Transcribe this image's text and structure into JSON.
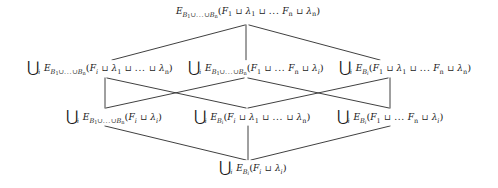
{
  "diagram": {
    "type": "hasse-lattice",
    "title": "",
    "nodes": [
      {
        "id": "top",
        "role": "top-element",
        "text": "E_{B1∪...∪Bn}(F1 ⊔ λ1 ⊔ ... Fn ⊔ λn)",
        "x": 248,
        "y": 12
      },
      {
        "id": "mid-left",
        "role": "upper-middle-left",
        "text": "⋃i E_{B1∪...∪Bn}(Fi ⊔ λ1 ⊔ ... ⊔ λn)",
        "x": 100,
        "y": 68
      },
      {
        "id": "mid-center",
        "role": "upper-middle-center",
        "text": "⋃i E_{B1∪...∪Bn}(F1 ⊔ ... ⊔ Fn ⊔ λi)",
        "x": 256,
        "y": 68
      },
      {
        "id": "mid-right",
        "role": "upper-middle-right",
        "text": "⋃i E_{Bi}(F1 ⊔ λ1 ⊔ ... Fn ⊔ λn)",
        "x": 405,
        "y": 68
      },
      {
        "id": "low-left",
        "role": "lower-middle-left",
        "text": "⋃i E_{B1∪...∪Bn}(Fi ⊔ λi)",
        "x": 114,
        "y": 117
      },
      {
        "id": "low-center",
        "role": "lower-middle-center",
        "text": "⋃i E_{Bi}(Fi ⊔ λ1 ⊔ ... ⊔ λn)",
        "x": 252,
        "y": 117
      },
      {
        "id": "low-right",
        "role": "lower-middle-right",
        "text": "⋃i E_{Bi}(F1 ⊔ ... ⊔ Fn ⊔ λi)",
        "x": 390,
        "y": 117
      },
      {
        "id": "bottom",
        "role": "bottom-element",
        "text": "⋃i E_{Bi}(Fi ⊔ λi)",
        "x": 253,
        "y": 168
      }
    ],
    "edges": [
      {
        "from": "top",
        "to": "mid-left"
      },
      {
        "from": "top",
        "to": "mid-center"
      },
      {
        "from": "top",
        "to": "mid-right"
      },
      {
        "from": "mid-left",
        "to": "low-left"
      },
      {
        "from": "mid-left",
        "to": "low-center"
      },
      {
        "from": "mid-center",
        "to": "low-left"
      },
      {
        "from": "mid-center",
        "to": "low-right"
      },
      {
        "from": "mid-right",
        "to": "low-center"
      },
      {
        "from": "mid-right",
        "to": "low-right"
      },
      {
        "from": "low-left",
        "to": "bottom"
      },
      {
        "from": "low-center",
        "to": "bottom"
      },
      {
        "from": "low-right",
        "to": "bottom"
      }
    ],
    "symbols": {
      "union_big": "⋃",
      "union_small": "∪",
      "sqcup": "⊔",
      "ellipsis": "...",
      "index": "i",
      "count": "n",
      "base_letter": "E",
      "family_letter": "F",
      "block_letter": "B",
      "lambda_letter": "λ"
    },
    "style": {
      "line_color": "#2a2a2a",
      "text_color": "#1a1a1a",
      "background": "#ffffff"
    }
  }
}
